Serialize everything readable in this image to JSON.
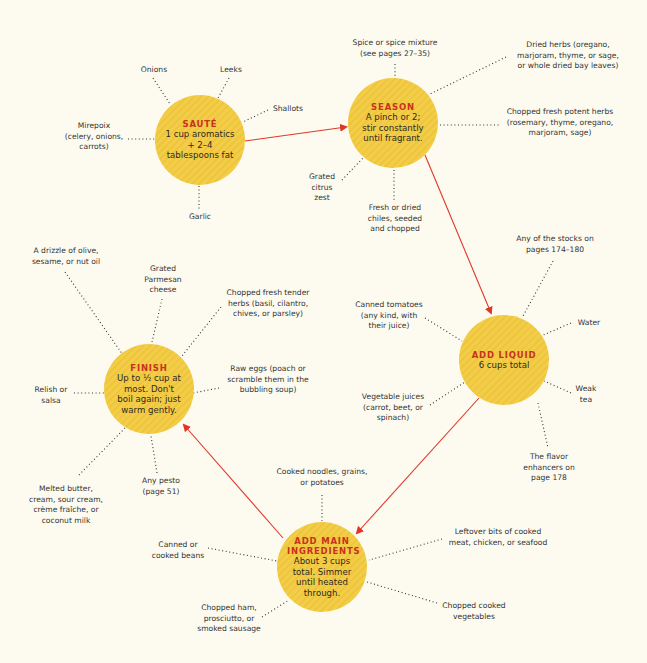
{
  "colors": {
    "background": "#fdfbef",
    "node_fill": "#f3cd48",
    "node_title": "#c8321a",
    "arrow": "#e0362a",
    "dotted_line": "#333333"
  },
  "nodes": {
    "saute": {
      "title": "SAUTÉ",
      "body": "1 cup aromatics + 2–4 tablespoons fat"
    },
    "season": {
      "title": "SEASON",
      "body": "A pinch or 2; stir constantly until fragrant."
    },
    "add_liquid": {
      "title": "ADD LIQUID",
      "body": "6 cups total"
    },
    "add_main": {
      "title": "ADD MAIN INGREDIENTS",
      "body": "About 3 cups total. Simmer until heated through."
    },
    "finish": {
      "title": "FINISH",
      "body": "Up to ½ cup at most. Don't boil again; just warm gently."
    }
  },
  "labels": {
    "saute": {
      "onions": "Onions",
      "leeks": "Leeks",
      "shallots": "Shallots",
      "mirepoix": "Mirepoix\n(celery, onions,\ncarrots)",
      "garlic": "Garlic"
    },
    "season": {
      "spice": "Spice or spice mixture\n(see pages 27–35)",
      "dried_herbs": "Dried herbs (oregano,\nmarjoram, thyme, or sage,\nor whole dried bay leaves)",
      "potent_herbs": "Chopped fresh potent herbs\n(rosemary, thyme, oregano,\nmarjoram, sage)",
      "citrus": "Grated\ncitrus\nzest",
      "chiles": "Fresh or dried\nchiles, seeded\nand chopped"
    },
    "add_liquid": {
      "stocks": "Any of the stocks on\npages 174–180",
      "tomatoes": "Canned tomatoes\n(any kind, with\ntheir juice)",
      "water": "Water",
      "veg_juices": "Vegetable juices\n(carrot, beet, or\nspinach)",
      "weak_tea": "Weak\ntea",
      "flavor_enhancers": "The flavor\nenhancers on\npage 178"
    },
    "add_main": {
      "noodles": "Cooked noodles, grains,\nor potatoes",
      "beans": "Canned or\ncooked beans",
      "leftover_meat": "Leftover bits of cooked\nmeat, chicken, or seafood",
      "ham": "Chopped ham,\nprosciutto, or\nsmoked sausage",
      "cooked_veg": "Chopped cooked\nvegetables"
    },
    "finish": {
      "oil": "A drizzle of olive,\nsesame, or nut oil",
      "parmesan": "Grated\nParmesan\ncheese",
      "tender_herbs": "Chopped fresh tender\nherbs (basil, cilantro,\nchives, or parsley)",
      "relish": "Relish or\nsalsa",
      "raw_eggs": "Raw eggs (poach or\nscramble them in the\nbubbling soup)",
      "butter": "Melted butter,\ncream, sour cream,\ncrème fraîche, or\ncoconut milk",
      "pesto": "Any pesto\n(page 51)"
    }
  }
}
